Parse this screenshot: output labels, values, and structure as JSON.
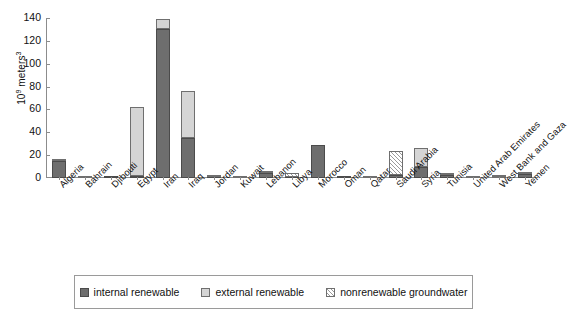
{
  "chart_data": {
    "type": "bar",
    "stacked": true,
    "title": "",
    "xlabel": "",
    "ylabel": "10⁹ meters³",
    "ylim": [
      0,
      140
    ],
    "yticks": [
      0,
      20,
      40,
      60,
      80,
      100,
      120,
      140
    ],
    "grid": false,
    "legend_position": "bottom",
    "categories": [
      "Algeria",
      "Bahrain",
      "Djibouti",
      "Egypt",
      "Iran",
      "Iraq",
      "Jordan",
      "Kuwait",
      "Lebanon",
      "Libya",
      "Morocco",
      "Oman",
      "Qatar",
      "Saudi Arabia",
      "Syria",
      "Tunisia",
      "United Arab Emirates",
      "West Bank and Gaza",
      "Yemen"
    ],
    "series": [
      {
        "name": "internal renewable",
        "color": "#6e6e6e",
        "values": [
          14.5,
          0.0,
          0.3,
          2.0,
          130.0,
          35.0,
          0.7,
          0.0,
          4.8,
          0.6,
          29.0,
          1.0,
          0.1,
          2.4,
          10.0,
          2.7,
          0.2,
          0.2,
          3.5
        ]
      },
      {
        "name": "external renewable",
        "color": "#d5d5d5",
        "values": [
          1.5,
          0.0,
          0.0,
          60.0,
          9.0,
          41.0,
          0.2,
          0.0,
          0.3,
          0.0,
          0.0,
          0.0,
          0.0,
          0.0,
          16.0,
          1.4,
          0.0,
          0.5,
          0.5
        ]
      },
      {
        "name": "nonrenewable groundwater",
        "color": "#ffffff",
        "hatched": true,
        "values": [
          0.0,
          0.2,
          0.0,
          0.0,
          0.0,
          0.0,
          0.1,
          0.5,
          0.0,
          3.8,
          0.0,
          0.0,
          0.1,
          21.5,
          0.0,
          0.0,
          1.0,
          0.2,
          0.0
        ]
      }
    ],
    "legend": [
      {
        "label": "internal renewable",
        "swatch": "internal-swatch"
      },
      {
        "label": "external renewable",
        "swatch": "external-swatch"
      },
      {
        "label": "nonrenewable groundwater",
        "swatch": "nonrenewable-swatch"
      }
    ]
  }
}
